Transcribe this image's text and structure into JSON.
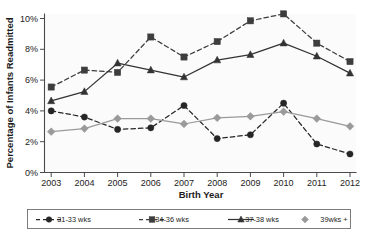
{
  "chart_data": {
    "type": "line",
    "title": "",
    "xlabel": "Birth Year",
    "ylabel": "Percentage of Infants Readmitted",
    "categories": [
      "2003",
      "2004",
      "2005",
      "2006",
      "2007",
      "2008",
      "2009",
      "2010",
      "2011",
      "2012"
    ],
    "x": [
      2003,
      2004,
      2005,
      2006,
      2007,
      2008,
      2009,
      2010,
      2011,
      2012
    ],
    "ylim": [
      0,
      10.8
    ],
    "xlim": [
      2002.6,
      2012.4
    ],
    "ytick_labels": [
      "0%",
      "2%",
      "4%",
      "6%",
      "8%",
      "10%"
    ],
    "ytick_values": [
      0,
      2,
      4,
      6,
      8,
      10
    ],
    "xtick_labels": [
      "2003",
      "2004",
      "2005",
      "2006",
      "2007",
      "2008",
      "2009",
      "2010",
      "2011",
      "2012"
    ],
    "grid": false,
    "legend_position": "below-plot",
    "series": [
      {
        "name": "31-33 wks",
        "marker": "circle",
        "linestyle": "dashed",
        "color": "#262626",
        "values": [
          4.0,
          3.6,
          2.8,
          2.9,
          4.35,
          2.2,
          2.45,
          4.5,
          1.85,
          1.2
        ]
      },
      {
        "name": "34-36 wks",
        "marker": "square",
        "linestyle": "dashed",
        "color": "#3d3d3d",
        "values": [
          5.55,
          6.65,
          6.5,
          8.8,
          7.5,
          8.5,
          9.85,
          10.3,
          8.4,
          7.2
        ]
      },
      {
        "name": "37-38 wks",
        "marker": "triangle",
        "linestyle": "solid",
        "color": "#333333",
        "values": [
          4.65,
          5.25,
          7.1,
          6.65,
          6.2,
          7.3,
          7.65,
          8.4,
          7.55,
          6.45
        ]
      },
      {
        "name": "39wks +",
        "marker": "diamond",
        "linestyle": "solid",
        "color": "#9a9a9a",
        "values": [
          2.65,
          2.85,
          3.5,
          3.5,
          3.15,
          3.55,
          3.65,
          3.95,
          3.5,
          3.0
        ]
      }
    ]
  },
  "legend": {
    "items": [
      {
        "label": "31-33 wks"
      },
      {
        "label": "34-36 wks"
      },
      {
        "label": "37-38 wks"
      },
      {
        "label": "39wks +"
      }
    ]
  },
  "axes": {
    "x_title": "Birth Year",
    "y_title": "Percentage of Infants Readmitted"
  }
}
